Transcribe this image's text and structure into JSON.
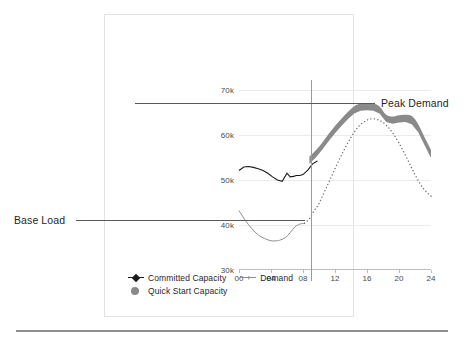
{
  "chart_data": {
    "type": "line",
    "title": "",
    "xlabel": "",
    "ylabel": "",
    "xlim": [
      0,
      24
    ],
    "ylim": [
      30000,
      70000
    ],
    "grid": true,
    "legend_position": "bottom-left",
    "x_tick_labels": [
      "00",
      "04",
      "08",
      "12",
      "16",
      "20",
      "24"
    ],
    "x_ticks": [
      0,
      4,
      8,
      12,
      16,
      20,
      24
    ],
    "y_tick_labels": [
      "70k",
      "60k",
      "50k",
      "40k",
      "30k"
    ],
    "y_ticks": [
      70000,
      60000,
      50000,
      40000,
      30000
    ],
    "series": [
      {
        "name": "Committed Capacity",
        "style": "solid-line",
        "color": "#1a1a1a",
        "x": [
          0.0,
          0.6,
          1.2,
          1.8,
          2.4,
          3.0,
          3.6,
          4.2,
          4.8,
          5.4,
          6.0,
          6.4,
          6.8,
          7.2,
          7.6,
          8.0,
          8.6,
          9.2,
          9.8
        ],
        "values": [
          52100,
          52900,
          53000,
          52800,
          52500,
          52100,
          51500,
          50700,
          50000,
          49700,
          51500,
          50700,
          50800,
          51000,
          51000,
          51200,
          52200,
          53600,
          54200
        ]
      },
      {
        "name": "Demand",
        "style": "solid-then-dotted",
        "color": "#8d8d8d",
        "x": [
          0.0,
          0.8,
          1.6,
          2.4,
          3.2,
          4.0,
          4.8,
          5.2,
          5.8,
          6.4,
          7.0,
          7.6,
          8.2,
          8.8,
          9.4,
          10.0,
          11.0,
          12.0,
          13.0,
          14.0,
          15.0,
          16.0,
          16.8,
          17.6,
          18.4,
          19.2,
          20.0,
          21.0,
          22.0,
          23.0,
          24.0
        ],
        "values": [
          43200,
          41000,
          39200,
          37800,
          37000,
          36500,
          36500,
          36700,
          37200,
          38300,
          39600,
          40200,
          40400,
          41400,
          43200,
          44800,
          48600,
          52500,
          56200,
          59500,
          62000,
          63300,
          63600,
          63200,
          62200,
          60500,
          58200,
          54800,
          51200,
          48200,
          46400
        ],
        "dotted_from_x": 8.6
      },
      {
        "name": "Quick Start Capacity",
        "style": "band",
        "color": "#8a8a8a",
        "x": [
          8.8,
          9.6,
          10.4,
          11.2,
          12.0,
          12.8,
          13.6,
          14.4,
          15.2,
          16.0,
          16.8,
          17.6,
          18.4,
          19.2,
          20.0,
          20.8,
          21.6,
          22.4,
          23.2,
          24.0
        ],
        "upper": [
          55200,
          56600,
          58300,
          60200,
          62000,
          63600,
          65100,
          66400,
          67000,
          67100,
          67000,
          66300,
          64500,
          64100,
          64400,
          64500,
          64200,
          62400,
          59500,
          56700
        ],
        "lower": [
          53600,
          55000,
          56700,
          58600,
          60400,
          62000,
          63500,
          64800,
          65400,
          65500,
          65400,
          64700,
          62900,
          62500,
          62800,
          62900,
          62400,
          60600,
          57700,
          54900
        ]
      }
    ],
    "reference_lines": [
      {
        "name": "Peak Demand",
        "orientation": "horizontal",
        "value": 63400,
        "label": "Peak Demand"
      },
      {
        "name": "Base Load",
        "orientation": "horizontal",
        "value": 36500,
        "label": "Base Load"
      },
      {
        "name": "current-time-marker",
        "orientation": "vertical",
        "value": 9,
        "label": ""
      }
    ]
  },
  "legend": {
    "items": [
      {
        "label": "Committed Capacity",
        "marker": "diamond-line-marker"
      },
      {
        "label": "Demand",
        "marker": "cross-line-marker"
      },
      {
        "label": "Quick Start Capacity",
        "marker": "filled-circle-marker"
      }
    ]
  },
  "annotations": {
    "peak_demand": "Peak Demand",
    "base_load": "Base Load"
  },
  "axis": {
    "y_labels": [
      "70k",
      "60k",
      "50k",
      "40k",
      "30k"
    ],
    "x_labels": [
      "00",
      "04",
      "08",
      "12",
      "16",
      "20",
      "24"
    ]
  },
  "colors": {
    "committed_capacity": "#1a1a1a",
    "demand": "#8d8d8d",
    "quick_start_capacity": "#8a8a8a",
    "annotation_line": "#595959",
    "gridline": "#ebebeb",
    "frame": "#e3e3e3"
  }
}
